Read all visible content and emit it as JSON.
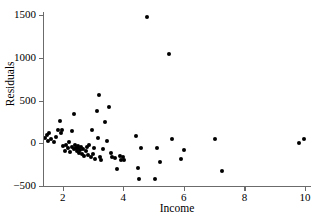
{
  "chart_data": {
    "type": "scatter",
    "title": "",
    "xlabel": "Income",
    "ylabel": "Residuals",
    "xlim": [
      1.35,
      10.2
    ],
    "ylim": [
      -500,
      1560
    ],
    "grid": false,
    "legend": null,
    "xticks": [
      2,
      4,
      6,
      8,
      10
    ],
    "xtick_labels": [
      "2",
      "4",
      "6",
      "8",
      "10"
    ],
    "yticks": [
      -500,
      0,
      500,
      1000,
      1500
    ],
    "ytick_labels": [
      "-500",
      "0",
      "500",
      "1000",
      "1500"
    ],
    "marker": "filled-circle",
    "marker_color": "#000000",
    "axis_color": "#6b6b6b",
    "points": [
      {
        "x": 1.42,
        "y": 60
      },
      {
        "x": 1.48,
        "y": 95
      },
      {
        "x": 1.52,
        "y": 30
      },
      {
        "x": 1.55,
        "y": 120
      },
      {
        "x": 1.62,
        "y": 45
      },
      {
        "x": 1.7,
        "y": 10
      },
      {
        "x": 1.78,
        "y": 70
      },
      {
        "x": 1.85,
        "y": 150
      },
      {
        "x": 1.92,
        "y": 265
      },
      {
        "x": 1.95,
        "y": 115
      },
      {
        "x": 1.98,
        "y": 150
      },
      {
        "x": 2.02,
        "y": -35
      },
      {
        "x": 2.08,
        "y": -90
      },
      {
        "x": 2.12,
        "y": -15
      },
      {
        "x": 2.18,
        "y": -60
      },
      {
        "x": 2.22,
        "y": 10
      },
      {
        "x": 2.25,
        "y": -100
      },
      {
        "x": 2.3,
        "y": 140
      },
      {
        "x": 2.32,
        "y": -45
      },
      {
        "x": 2.36,
        "y": 345
      },
      {
        "x": 2.38,
        "y": -70
      },
      {
        "x": 2.42,
        "y": -25
      },
      {
        "x": 2.45,
        "y": -55
      },
      {
        "x": 2.48,
        "y": -90
      },
      {
        "x": 2.5,
        "y": -35
      },
      {
        "x": 2.52,
        "y": -60
      },
      {
        "x": 2.55,
        "y": -110
      },
      {
        "x": 2.58,
        "y": -80
      },
      {
        "x": 2.6,
        "y": -40
      },
      {
        "x": 2.64,
        "y": -125
      },
      {
        "x": 2.68,
        "y": -70
      },
      {
        "x": 2.72,
        "y": -150
      },
      {
        "x": 2.76,
        "y": -95
      },
      {
        "x": 2.8,
        "y": -45
      },
      {
        "x": 2.84,
        "y": -140
      },
      {
        "x": 2.88,
        "y": -20
      },
      {
        "x": 2.92,
        "y": -160
      },
      {
        "x": 2.96,
        "y": 160
      },
      {
        "x": 3.0,
        "y": -120
      },
      {
        "x": 3.04,
        "y": -55
      },
      {
        "x": 3.08,
        "y": -185
      },
      {
        "x": 3.12,
        "y": 380
      },
      {
        "x": 3.16,
        "y": 60
      },
      {
        "x": 3.2,
        "y": 565
      },
      {
        "x": 3.24,
        "y": -155
      },
      {
        "x": 3.28,
        "y": -200
      },
      {
        "x": 3.32,
        "y": -70
      },
      {
        "x": 3.4,
        "y": 250
      },
      {
        "x": 3.46,
        "y": 30
      },
      {
        "x": 3.52,
        "y": 430
      },
      {
        "x": 3.58,
        "y": -110
      },
      {
        "x": 3.64,
        "y": -160
      },
      {
        "x": 3.72,
        "y": -175
      },
      {
        "x": 3.78,
        "y": -305
      },
      {
        "x": 3.88,
        "y": -145
      },
      {
        "x": 3.94,
        "y": -190
      },
      {
        "x": 3.98,
        "y": -165
      },
      {
        "x": 4.02,
        "y": -200
      },
      {
        "x": 4.42,
        "y": 85
      },
      {
        "x": 4.48,
        "y": -285
      },
      {
        "x": 4.52,
        "y": -415
      },
      {
        "x": 4.58,
        "y": -55
      },
      {
        "x": 4.8,
        "y": 1480
      },
      {
        "x": 5.05,
        "y": -420
      },
      {
        "x": 5.1,
        "y": -60
      },
      {
        "x": 5.22,
        "y": -215
      },
      {
        "x": 5.5,
        "y": 1045
      },
      {
        "x": 5.62,
        "y": 50
      },
      {
        "x": 5.92,
        "y": -185
      },
      {
        "x": 6.02,
        "y": -75
      },
      {
        "x": 7.02,
        "y": 45
      },
      {
        "x": 7.26,
        "y": -320
      },
      {
        "x": 9.82,
        "y": 5
      },
      {
        "x": 9.98,
        "y": 45
      }
    ]
  }
}
